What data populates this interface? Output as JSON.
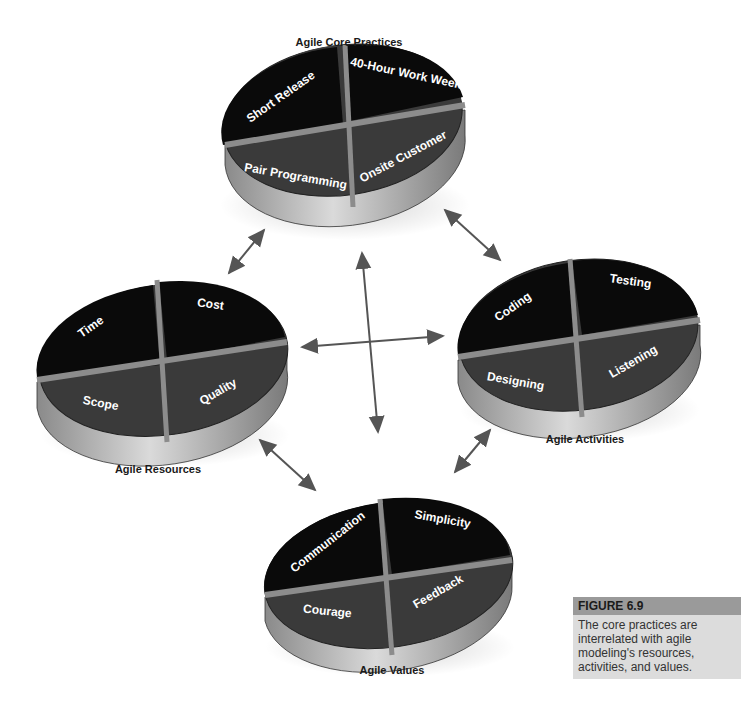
{
  "figure": {
    "number_label": "FIGURE 6.9",
    "caption": "The core practices are interrelated with agile modeling's resources, activities, and values."
  },
  "groups": {
    "core_practices": {
      "title": "Agile Core Practices",
      "segments": [
        "Short Release",
        "40-Hour Work Week",
        "Pair Programming",
        "Onsite Customer"
      ]
    },
    "activities": {
      "title": "Agile Activities",
      "segments": [
        "Coding",
        "Testing",
        "Designing",
        "Listening"
      ]
    },
    "resources": {
      "title": "Agile Resources",
      "segments": [
        "Time",
        "Cost",
        "Scope",
        "Quality"
      ]
    },
    "values": {
      "title": "Agile Values",
      "segments": [
        "Communication",
        "Simplicity",
        "Courage",
        "Feedback"
      ]
    }
  },
  "colors": {
    "top_segments": "#0a0a0a",
    "bottom_segments": "#3a3a3a",
    "divider": "#8c8c8c",
    "rim": "#b5b5b5",
    "arrow": "#555555"
  }
}
